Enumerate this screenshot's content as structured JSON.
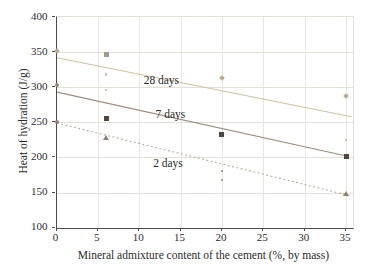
{
  "chart_data": {
    "type": "scatter",
    "title": "",
    "xlabel": "Mineral admixture content of the cement (%, by mass)",
    "ylabel": "Heat of hydration (J/g)",
    "xlim": [
      0,
      35.8
    ],
    "ylim": [
      100,
      400
    ],
    "xticks": [
      0,
      5,
      10,
      15,
      20,
      25,
      30,
      35
    ],
    "yticks": [
      100,
      150,
      200,
      250,
      300,
      350,
      400
    ],
    "grid": true,
    "legend_position": "inline-labels",
    "axis_color": "#4a4a4a",
    "grid_color": "#e3e0d9",
    "text_color": "#2b2b2b",
    "series": [
      {
        "name": "28 days",
        "line_color": "#cfc2a4",
        "marker_color": "#b9ab8e",
        "line_style": "solid",
        "fit_line": {
          "x1": 0,
          "v1": 342,
          "x2": 35.6,
          "v2": 258
        },
        "points": [
          {
            "x": 0,
            "v": 351,
            "shape": "diamond"
          },
          {
            "x": 6,
            "v": 347,
            "shape": "square",
            "color": "#a29a8c"
          },
          {
            "x": 6,
            "v": 318,
            "shape": "dot",
            "color": "#c3b8a6"
          },
          {
            "x": 20,
            "v": 313,
            "shape": "diamond"
          },
          {
            "x": 35,
            "v": 288,
            "shape": "diamond"
          }
        ],
        "label": {
          "text": "28 days",
          "x": 12.8,
          "v": 309
        }
      },
      {
        "name": "7 days",
        "line_color": "#9c8d7d",
        "marker_color": "#52453e",
        "line_style": "solid",
        "fit_line": {
          "x1": 0,
          "v1": 293,
          "x2": 35,
          "v2": 202
        },
        "points": [
          {
            "x": 0,
            "v": 303,
            "shape": "circle",
            "color": "#958a7e"
          },
          {
            "x": 6,
            "v": 296,
            "shape": "dot",
            "color": "#bcb1a2"
          },
          {
            "x": 6,
            "v": 255,
            "shape": "square"
          },
          {
            "x": 20,
            "v": 233,
            "shape": "square"
          },
          {
            "x": 35,
            "v": 225,
            "shape": "dot",
            "color": "#bcb1a2"
          },
          {
            "x": 35,
            "v": 201,
            "shape": "square"
          }
        ],
        "label": {
          "text": "7 days",
          "x": 13.9,
          "v": 261
        }
      },
      {
        "name": "2 days",
        "line_color": "#b3a593",
        "marker_color": "#8f8274",
        "line_style": "dotted",
        "fit_line": {
          "x1": 0,
          "v1": 249,
          "x2": 35.6,
          "v2": 145
        },
        "points": [
          {
            "x": 0,
            "v": 250,
            "shape": "circle"
          },
          {
            "x": 6,
            "v": 228,
            "shape": "triangle"
          },
          {
            "x": 20,
            "v": 181,
            "shape": "dot"
          },
          {
            "x": 20,
            "v": 168,
            "shape": "dot"
          },
          {
            "x": 35,
            "v": 148,
            "shape": "triangle"
          }
        ],
        "label": {
          "text": "2 days",
          "x": 13.6,
          "v": 190
        }
      }
    ]
  }
}
